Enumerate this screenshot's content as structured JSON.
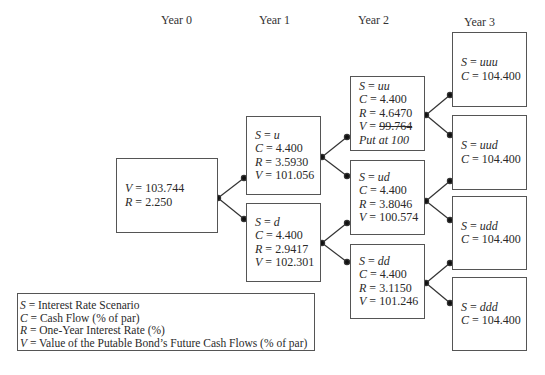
{
  "years": [
    "Year 0",
    "Year 1",
    "Year 2",
    "Year 3"
  ],
  "nodes": {
    "root": {
      "v": "103.744",
      "r": "2.250"
    },
    "u": {
      "s": "u",
      "c": "4.400",
      "r": "3.5930",
      "v": "101.056"
    },
    "d": {
      "s": "d",
      "c": "4.400",
      "r": "2.9417",
      "v": "102.301"
    },
    "uu": {
      "s": "uu",
      "c": "4.400",
      "r": "4.6470",
      "v": "99.764",
      "note": "Put at 100"
    },
    "ud": {
      "s": "ud",
      "c": "4.400",
      "r": "3.8046",
      "v": "100.574"
    },
    "dd": {
      "s": "dd",
      "c": "4.400",
      "r": "3.1150",
      "v": "101.246"
    },
    "uuu": {
      "s": "uuu",
      "c": "104.400"
    },
    "uud": {
      "s": "uud",
      "c": "104.400"
    },
    "udd": {
      "s": "udd",
      "c": "104.400"
    },
    "ddd": {
      "s": "ddd",
      "c": "104.400"
    }
  },
  "labels": {
    "s": "S",
    "c": "C",
    "r": "R",
    "v": "V",
    "eq": " = "
  },
  "legend": [
    {
      "sym": "S",
      "text": " = Interest Rate Scenario"
    },
    {
      "sym": "C",
      "text": " = Cash Flow (% of par)"
    },
    {
      "sym": "R",
      "text": " = One-Year Interest Rate (%)"
    },
    {
      "sym": "V",
      "text": " = Value of the Putable Bond’s Future Cash Flows (% of par)"
    }
  ]
}
